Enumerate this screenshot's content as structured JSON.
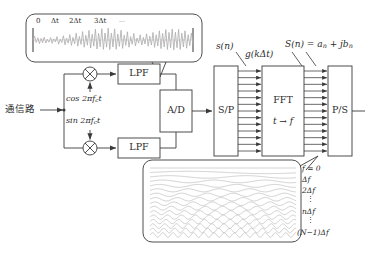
{
  "diagram": {
    "background": "#ffffff",
    "line_color": "#3a3a3a",
    "wave_color": "#b8b8b8",
    "text_color": "#2b2b2b"
  },
  "input": {
    "label": "通信路"
  },
  "oscillators": {
    "cos_label": "cos 2πf",
    "cos_sub": "c",
    "cos_tail": "t",
    "sin_label": "sin 2πf",
    "sin_sub": "c",
    "sin_tail": "t"
  },
  "blocks": {
    "mixer_top": "⊗",
    "mixer_bottom": "⊗",
    "lpf_top": "LPF",
    "lpf_bottom": "LPF",
    "ad": "A/D",
    "sp": "S/P",
    "fft_line1": "FFT",
    "fft_line2": "t → f",
    "ps": "P/S"
  },
  "signal_labels": {
    "s_n": "s(n)",
    "g_kdt": "g(kΔt)",
    "S_n": "S(n) = a",
    "S_n_sub1": "n",
    "S_n_mid": " + jb",
    "S_n_sub2": "n"
  },
  "time_callout": {
    "ticks": [
      "0",
      "Δt",
      "2Δt",
      "3Δt",
      "⋯"
    ]
  },
  "freq_callout": {
    "labels": [
      "f = 0",
      "Δf",
      "2Δf",
      "⋮",
      "nΔf",
      "⋮",
      "(N−1)Δf"
    ]
  },
  "bus": {
    "arrow_count": 13
  }
}
